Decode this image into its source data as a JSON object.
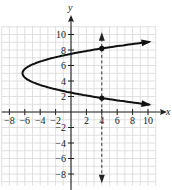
{
  "chart_data": {
    "type": "line",
    "title": "",
    "xlabel": "x",
    "ylabel": "y",
    "xlim": [
      -9,
      11
    ],
    "ylim": [
      -9,
      11
    ],
    "grid": true,
    "x_ticks": [
      -8,
      -6,
      -4,
      -2,
      2,
      4,
      6,
      8,
      10
    ],
    "y_ticks": [
      -8,
      -6,
      -4,
      -2,
      2,
      4,
      6,
      8,
      10
    ],
    "x_tick_labels": [
      "−8",
      "−6",
      "−4",
      "−2",
      "2",
      "4",
      "6",
      "8",
      "10"
    ],
    "y_tick_labels": [
      "−8",
      "−6",
      "−4",
      "−2",
      "2",
      "4",
      "6",
      "8",
      "10"
    ],
    "series": [
      {
        "name": "sideways parabola",
        "description": "Parabola opening right, vertex near (-6, 5)",
        "points": [
          [
            10,
            1
          ],
          [
            4,
            1.8
          ],
          [
            0,
            2.6
          ],
          [
            -4,
            3.6
          ],
          [
            -6.3,
            5
          ],
          [
            -4,
            6.4
          ],
          [
            0,
            7.4
          ],
          [
            4,
            8.2
          ],
          [
            10,
            9
          ]
        ]
      },
      {
        "name": "vertical line test",
        "style": "dashed",
        "x": 4,
        "y_range": [
          -9,
          10
        ]
      }
    ],
    "marked_points": [
      [
        4,
        8.2
      ],
      [
        4,
        1.8
      ]
    ]
  },
  "labels": {
    "x_axis": "x",
    "y_axis": "y"
  }
}
